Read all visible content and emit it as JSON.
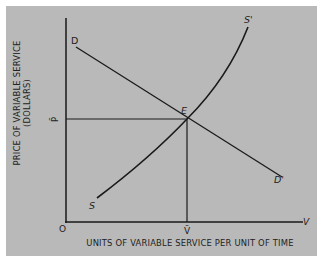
{
  "diagram": {
    "type": "supply-demand",
    "background_color": "#b9b9b9",
    "line_color": "#1a1a1a",
    "y_axis": {
      "label_line1": "PRICE OF VARIABLE SERVICE",
      "label_line2": "(DOLLARS)",
      "tick_label": "P̄"
    },
    "x_axis": {
      "label": "UNITS OF VARIABLE SERVICE PER UNIT OF TIME",
      "end_label": "V",
      "tick_label": "V̄"
    },
    "origin_label": "O",
    "demand_curve": {
      "start_label": "D",
      "end_label": "D'"
    },
    "supply_curve": {
      "start_label": "S",
      "end_label": "S'"
    },
    "equilibrium": {
      "label": "E"
    }
  }
}
